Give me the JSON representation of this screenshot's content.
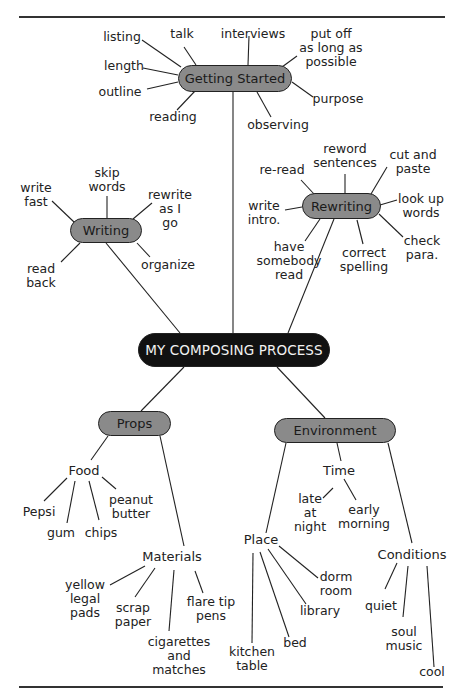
{
  "title": "MY COMPOSING PROCESS",
  "colors": {
    "root_fill": "#111111",
    "branch_fill": "#8a8a8a",
    "line": "#222222"
  },
  "branches": {
    "getting_started": {
      "label": "Getting Started",
      "leaves": [
        "listing",
        "talk",
        "interviews",
        "put off\nas long as\npossible",
        "length",
        "outline",
        "purpose",
        "reading",
        "observing"
      ]
    },
    "writing": {
      "label": "Writing",
      "leaves": [
        "write\nfast",
        "skip\nwords",
        "rewrite\nas I\ngo",
        "read\nback",
        "organize"
      ]
    },
    "rewriting": {
      "label": "Rewriting",
      "leaves": [
        "re-read",
        "reword\nsentences",
        "cut and\npaste",
        "write\nintro.",
        "look up\nwords",
        "have\nsomebody\nread",
        "correct\nspelling",
        "check\npara."
      ]
    },
    "props": {
      "label": "Props",
      "food": {
        "label": "Food",
        "leaves": [
          "Pepsi",
          "gum",
          "chips",
          "peanut\nbutter"
        ]
      },
      "materials": {
        "label": "Materials",
        "leaves": [
          "yellow\nlegal\npads",
          "scrap\npaper",
          "cigarettes\nand\nmatches",
          "flare tip\npens"
        ]
      }
    },
    "environment": {
      "label": "Environment",
      "time": {
        "label": "Time",
        "leaves": [
          "late\nat\nnight",
          "early\nmorning"
        ]
      },
      "place": {
        "label": "Place",
        "leaves": [
          "kitchen\ntable",
          "bed",
          "library",
          "dorm\nroom"
        ]
      },
      "conditions": {
        "label": "Conditions",
        "leaves": [
          "quiet",
          "soul\nmusic",
          "cool"
        ]
      }
    }
  }
}
